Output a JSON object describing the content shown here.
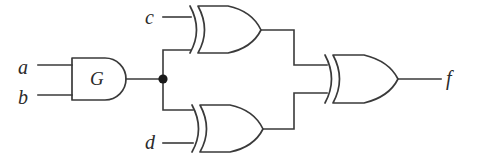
{
  "figure": {
    "background_color": "#ffffff",
    "line_color": "#3a3a3a",
    "width": 482,
    "height": 162
  },
  "inputs": [
    {
      "id": "a",
      "label": "a",
      "x": 18,
      "y": 57
    },
    {
      "id": "b",
      "label": "b",
      "x": 18,
      "y": 87
    },
    {
      "id": "c",
      "label": "c",
      "x": 145,
      "y": 7
    },
    {
      "id": "d",
      "label": "d",
      "x": 145,
      "y": 132
    }
  ],
  "outputs": [
    {
      "id": "f",
      "label": "f",
      "x": 446,
      "y": 68
    }
  ],
  "gates": [
    {
      "id": "G",
      "label": "G",
      "type": "and-gate",
      "inputs": [
        "a",
        "b"
      ],
      "output_node": "n1"
    },
    {
      "id": "X1",
      "label": "",
      "type": "xor-gate",
      "inputs": [
        "c",
        "n1"
      ],
      "output_node": "n2"
    },
    {
      "id": "X2",
      "label": "",
      "type": "xor-gate",
      "inputs": [
        "n1",
        "d"
      ],
      "output_node": "n3"
    },
    {
      "id": "X3",
      "label": "",
      "type": "xor-gate",
      "inputs": [
        "n2",
        "n3"
      ],
      "output_node": "f"
    }
  ],
  "junctions": [
    {
      "id": "n1",
      "x": 163,
      "y": 79,
      "label": "fan-out-node"
    }
  ],
  "icons": {
    "junction": "junction-dot-icon",
    "and_gate": "and-gate-icon",
    "xor_gate": "xor-gate-icon"
  }
}
